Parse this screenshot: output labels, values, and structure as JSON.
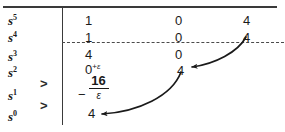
{
  "figure": {
    "type": "routh-array",
    "rules": {
      "top_rule": "solid",
      "column_divider": "solid",
      "sign_change_divider": "dashed"
    }
  },
  "row_labels": [
    {
      "base": "s",
      "exponent": "5"
    },
    {
      "base": "s",
      "exponent": "4"
    },
    {
      "base": "s",
      "exponent": "3"
    },
    {
      "base": "s",
      "exponent": "2"
    },
    {
      "base": "s",
      "exponent": "1"
    },
    {
      "base": "s",
      "exponent": "0"
    }
  ],
  "sign_change_markers": [
    {
      "symbol": ">",
      "between_rows": "s2-s1"
    },
    {
      "symbol": ">",
      "between_rows": "s1-s0"
    }
  ],
  "table": {
    "rows": [
      {
        "label": "s^5",
        "c1": "1",
        "c2": "0",
        "c3": "4"
      },
      {
        "label": "s^4",
        "c1": "1",
        "c2": "0",
        "c3": "4"
      },
      {
        "label": "s^3",
        "c1": "4",
        "c2": "0",
        "c3": ""
      },
      {
        "label": "s^2",
        "c1": "0",
        "c1_sup_plus": "+",
        "c1_sup_eps": "ε",
        "c2": "4",
        "c3": ""
      },
      {
        "label": "s^1",
        "c1_fraction": {
          "sign": "−",
          "numerator": "16",
          "denominator": "ε"
        },
        "c2": "",
        "c3": ""
      },
      {
        "label": "s^0",
        "c1": "4",
        "c2": "",
        "c3": ""
      }
    ]
  },
  "annotations": {
    "arrows": [
      {
        "name": "arrow-s4c3-to-s2c2",
        "from": "s^4 column 3 value 4",
        "to": "s^2 column 2 value 4",
        "style": "curved-with-arrowhead"
      },
      {
        "name": "arrow-s2c2-to-s0c1",
        "from": "s^2 column 2 value 4",
        "to": "s^0 column 1 value 4",
        "style": "curved-with-arrowhead"
      }
    ]
  },
  "colors": {
    "ink": "#1a1a1a",
    "rule": "#3a3a3a",
    "dashed_rule": "#4a4a4a",
    "background": "#ffffff"
  }
}
